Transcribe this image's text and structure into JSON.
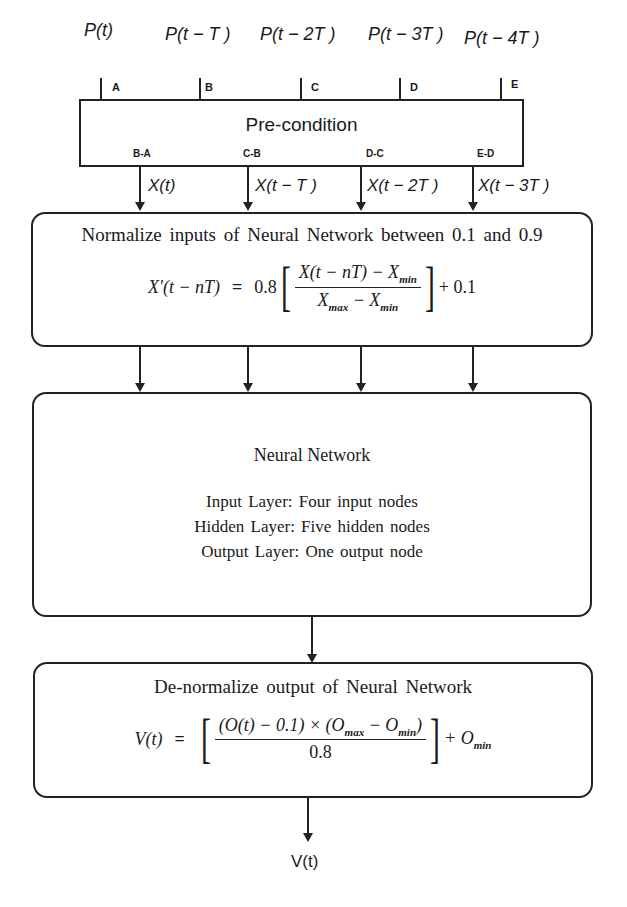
{
  "inputs": [
    {
      "signal": "P(t)",
      "tap": "A"
    },
    {
      "signal": "P(t − T )",
      "tap": "B"
    },
    {
      "signal": "P(t − 2T )",
      "tap": "C"
    },
    {
      "signal": "P(t − 3T )",
      "tap": "D"
    },
    {
      "signal": "P(t − 4T )",
      "tap": "E"
    }
  ],
  "precondition": {
    "title": "Pre-condition",
    "outputs": [
      "B-A",
      "C-B",
      "D-C",
      "E-D"
    ]
  },
  "differences": [
    "X(t)",
    "X(t − T )",
    "X(t − 2T )",
    "X(t − 3T )"
  ],
  "normalize": {
    "title": "Normalize inputs of Neural Network between 0.1 and 0.9",
    "lhs": "X′(t − nT)",
    "eq": "=",
    "coef": "0.8",
    "numerator": "X(t − nT) − X",
    "numerator_sub": "min",
    "den_a": "X",
    "den_a_sub": "max",
    "den_minus": " − X",
    "den_b_sub": "min",
    "tail": "+ 0.1"
  },
  "neural_network": {
    "title": "Neural Network",
    "layers": [
      "Input Layer: Four input nodes",
      "Hidden Layer: Five hidden nodes",
      "Output Layer: One output node"
    ]
  },
  "denormalize": {
    "title": "De-normalize output of Neural Network",
    "lhs": "V(t)",
    "eq": "=",
    "numerator_a": "(O(t) − 0.1) × (O",
    "numerator_a_sub": "max",
    "numerator_b": " − O",
    "numerator_b_sub": "min",
    "numerator_close": ")",
    "denominator": "0.8",
    "tail": "+ O",
    "tail_sub": "min"
  },
  "output": {
    "label": "V(t)"
  },
  "colors": {
    "stroke": "#222222",
    "background": "#ffffff"
  }
}
